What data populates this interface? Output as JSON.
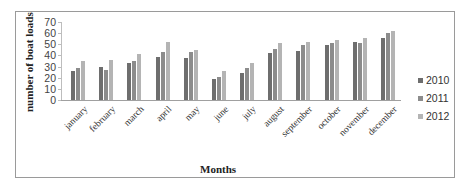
{
  "chart_data": {
    "type": "bar",
    "title": "",
    "xlabel": "Months",
    "ylabel": "number of boat loads",
    "ylim": [
      0,
      70
    ],
    "yticks": [
      0,
      10,
      20,
      30,
      40,
      50,
      60,
      70
    ],
    "grid": false,
    "legend_position": "right",
    "categories": [
      "january",
      "february",
      "march",
      "april",
      "may",
      "june",
      "july",
      "august",
      "september",
      "october",
      "november",
      "december"
    ],
    "series": [
      {
        "name": "2010",
        "color": "#6e6e6e",
        "values": [
          26,
          30,
          33,
          39,
          38,
          19,
          24,
          42,
          44,
          49,
          52,
          56
        ]
      },
      {
        "name": "2011",
        "color": "#8c8c8c",
        "values": [
          29,
          27,
          35,
          43,
          43,
          21,
          29,
          46,
          49,
          51,
          51,
          60
        ]
      },
      {
        "name": "2012",
        "color": "#b4b4b4",
        "values": [
          35,
          36,
          41,
          52,
          45,
          26,
          33,
          51,
          52,
          54,
          56,
          62
        ]
      }
    ]
  }
}
